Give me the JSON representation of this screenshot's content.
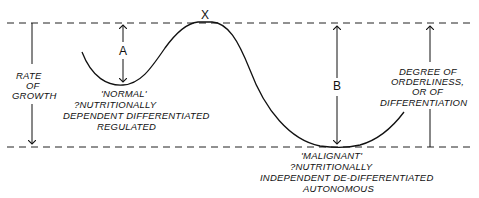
{
  "diagram": {
    "peak_label": "X",
    "left_axis": {
      "lines": [
        "RATE",
        "OF",
        "GROWTH"
      ]
    },
    "right_axis": {
      "lines": [
        "DEGREE OF",
        "ORDERLINESS,",
        "OR OF",
        "DIFFERENTIATION"
      ]
    },
    "gap_a_label": "A",
    "gap_b_label": "B",
    "normal_state": {
      "lines": [
        "'NORMAL'",
        "?NUTRITIONALLY",
        "DEPENDENT  DIFFERENTIATED",
        "REGULATED"
      ]
    },
    "malignant_state": {
      "lines": [
        "'MALIGNANT'",
        "?NUTRITIONALLY",
        "INDEPENDENT  DE-DIFFERENTIATED",
        "AUTONOMOUS"
      ]
    },
    "colors": {
      "ink": "#111111",
      "background": "#ffffff"
    }
  }
}
